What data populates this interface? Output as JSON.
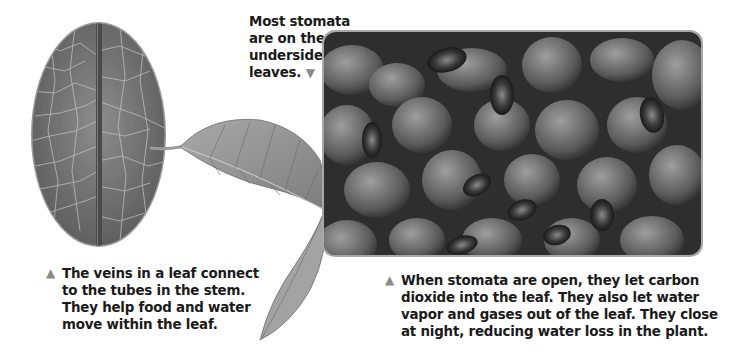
{
  "figure": {
    "top_callout": {
      "lines": [
        "Most stomata",
        "are on the",
        "undersides of",
        "leaves."
      ],
      "pointer_icon": "triangle-down"
    },
    "left_caption": {
      "pointer_icon": "triangle-up",
      "lines": [
        "The veins in a leaf connect",
        "to the tubes in the stem.",
        "They help food and water",
        "move within the leaf."
      ]
    },
    "right_caption": {
      "pointer_icon": "triangle-up",
      "lines": [
        "When stomata are open, they let carbon",
        "dioxide into the leaf. They also let water",
        "vapor and gases out of the leaf. They close",
        "at night, reducing water loss in the plant."
      ]
    },
    "images": {
      "leaf_closeup": "magnified leaf underside with veins (oval)",
      "leaf_whole": "whole leaf on stem",
      "stomata_micrograph": "electron micrograph of leaf surface with stomata"
    },
    "colors": {
      "text": "#1a1a1a",
      "pointer": "#8a8a8a",
      "frame_border": "#a8a8a8"
    }
  }
}
